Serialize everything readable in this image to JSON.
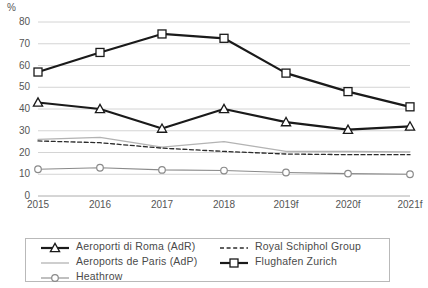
{
  "chart_data": {
    "type": "line",
    "title": "",
    "xlabel": "",
    "ylabel": "%",
    "categories": [
      "2015",
      "2016",
      "2017",
      "2018",
      "2019f",
      "2020f",
      "2021f"
    ],
    "ylim": [
      0,
      80
    ],
    "ytick_values": [
      0,
      10,
      20,
      30,
      40,
      50,
      60,
      70,
      80
    ],
    "ytick_labels": [
      "0",
      "10",
      "20",
      "30",
      "40",
      "50",
      "60",
      "70",
      "80"
    ],
    "grid": true,
    "legend_position": "bottom",
    "series": [
      {
        "name": "Aeroporti di Roma (AdR)",
        "marker": "triangle",
        "line_style": "solid",
        "color": "#1a1a1a",
        "line_width": 2.2,
        "values": [
          43,
          40,
          31,
          40,
          34,
          30.5,
          32
        ]
      },
      {
        "name": "Aeroports de Paris (AdP)",
        "marker": "none",
        "line_style": "solid",
        "color": "#b3b3b3",
        "line_width": 1.3,
        "values": [
          26,
          27,
          22.5,
          25,
          20.5,
          20.5,
          20.3
        ]
      },
      {
        "name": "Heathrow",
        "marker": "circle",
        "line_style": "solid",
        "color": "#8a8a8a",
        "line_width": 1.1,
        "values": [
          12.3,
          13,
          12,
          11.7,
          10.8,
          10.3,
          10
        ]
      },
      {
        "name": "Royal Schiphol Group",
        "marker": "none",
        "line_style": "dashed",
        "color": "#2b2b2b",
        "line_width": 1.3,
        "values": [
          25.3,
          24.5,
          22,
          20.5,
          19.3,
          19,
          19
        ]
      },
      {
        "name": "Flughafen Zurich",
        "marker": "square",
        "line_style": "solid",
        "color": "#1a1a1a",
        "line_width": 2.2,
        "values": [
          57,
          66,
          74.5,
          72.5,
          56.5,
          48,
          41
        ]
      }
    ]
  },
  "axis": {
    "unit_label": "%"
  },
  "colors": {
    "grid": "#d4d4d4",
    "axis_text": "#555555",
    "dark_series": "#1a1a1a",
    "grey_series": "#b3b3b3",
    "heathrow_series": "#8a8a8a",
    "dashed_series": "#2b2b2b",
    "legend_border": "#b9b9b9"
  }
}
